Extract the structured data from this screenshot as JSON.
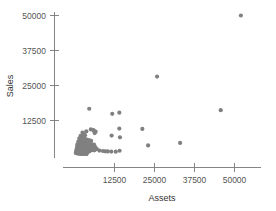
{
  "chart_data": {
    "type": "scatter",
    "title": "",
    "xlabel": "Assets",
    "ylabel": "Sales",
    "xticks": [
      12500,
      25000,
      37500,
      50000
    ],
    "yticks": [
      12500,
      25000,
      37500,
      50000
    ],
    "xtick_labels": [
      "12500",
      "25000",
      "37500",
      "50000"
    ],
    "ytick_labels": [
      "12500",
      "25000",
      "37500",
      "50000"
    ],
    "xlim": [
      0,
      54000
    ],
    "ylim": [
      0,
      52000
    ],
    "grid": false,
    "legend": null,
    "marker_color": "#808080",
    "marker_size": 3,
    "points": [
      [
        52000,
        50000
      ],
      [
        25800,
        28200
      ],
      [
        45700,
        16200
      ],
      [
        4600,
        16700
      ],
      [
        11800,
        14900
      ],
      [
        14000,
        15300
      ],
      [
        14000,
        9600
      ],
      [
        21200,
        9500
      ],
      [
        3700,
        8600
      ],
      [
        5100,
        9300
      ],
      [
        6000,
        8900
      ],
      [
        6600,
        8500
      ],
      [
        11600,
        7100
      ],
      [
        14200,
        6500
      ],
      [
        33000,
        4500
      ],
      [
        23000,
        3600
      ],
      [
        2500,
        8200
      ],
      [
        2900,
        7600
      ],
      [
        3300,
        7200
      ],
      [
        1900,
        7000
      ],
      [
        2200,
        6600
      ],
      [
        2700,
        6300
      ],
      [
        3100,
        6000
      ],
      [
        3600,
        5800
      ],
      [
        4100,
        5600
      ],
      [
        4700,
        5400
      ],
      [
        5200,
        5200
      ],
      [
        1500,
        6100
      ],
      [
        1800,
        5700
      ],
      [
        2100,
        5300
      ],
      [
        2400,
        5000
      ],
      [
        2800,
        4800
      ],
      [
        3200,
        4600
      ],
      [
        3700,
        4400
      ],
      [
        4200,
        4200
      ],
      [
        4800,
        4100
      ],
      [
        5400,
        4000
      ],
      [
        6100,
        3900
      ],
      [
        1200,
        5000
      ],
      [
        1500,
        4700
      ],
      [
        1800,
        4400
      ],
      [
        2100,
        4100
      ],
      [
        2500,
        3900
      ],
      [
        2900,
        3700
      ],
      [
        3400,
        3500
      ],
      [
        3900,
        3400
      ],
      [
        4500,
        3300
      ],
      [
        5100,
        3200
      ],
      [
        5800,
        3100
      ],
      [
        6500,
        3000
      ],
      [
        900,
        4000
      ],
      [
        1200,
        3800
      ],
      [
        1500,
        3500
      ],
      [
        1900,
        3300
      ],
      [
        2300,
        3100
      ],
      [
        2700,
        2900
      ],
      [
        3200,
        2800
      ],
      [
        3700,
        2700
      ],
      [
        4300,
        2600
      ],
      [
        4900,
        2500
      ],
      [
        5600,
        2400
      ],
      [
        6300,
        2300
      ],
      [
        7000,
        2250
      ],
      [
        800,
        3100
      ],
      [
        1100,
        2900
      ],
      [
        1400,
        2700
      ],
      [
        1800,
        2500
      ],
      [
        2200,
        2400
      ],
      [
        2600,
        2300
      ],
      [
        3100,
        2200
      ],
      [
        3600,
        2100
      ],
      [
        4200,
        2000
      ],
      [
        4800,
        1950
      ],
      [
        5500,
        1900
      ],
      [
        6200,
        1850
      ],
      [
        700,
        2400
      ],
      [
        1000,
        2200
      ],
      [
        1300,
        2050
      ],
      [
        1700,
        1900
      ],
      [
        2100,
        1800
      ],
      [
        2500,
        1700
      ],
      [
        3000,
        1650
      ],
      [
        3500,
        1600
      ],
      [
        4100,
        1550
      ],
      [
        4700,
        1500
      ],
      [
        600,
        1800
      ],
      [
        900,
        1650
      ],
      [
        1200,
        1500
      ],
      [
        1600,
        1400
      ],
      [
        2000,
        1300
      ],
      [
        2400,
        1250
      ],
      [
        2900,
        1200
      ],
      [
        3400,
        1150
      ],
      [
        4000,
        1100
      ],
      [
        500,
        1300
      ],
      [
        800,
        1150
      ],
      [
        1100,
        1050
      ],
      [
        1500,
        950
      ],
      [
        1900,
        900
      ],
      [
        2300,
        850
      ],
      [
        2800,
        800
      ],
      [
        3300,
        780
      ],
      [
        400,
        900
      ],
      [
        700,
        800
      ],
      [
        1000,
        720
      ],
      [
        1400,
        650
      ],
      [
        1800,
        600
      ],
      [
        2200,
        570
      ],
      [
        2700,
        550
      ],
      [
        3200,
        530
      ],
      [
        3800,
        520
      ],
      [
        8900,
        1600
      ],
      [
        9600,
        1500
      ],
      [
        10400,
        1450
      ],
      [
        11500,
        1400
      ],
      [
        12900,
        1350
      ],
      [
        14100,
        1700
      ],
      [
        7800,
        1750
      ],
      [
        5900,
        9100
      ],
      [
        6300,
        8000
      ]
    ]
  },
  "axes": {
    "x_axis_name": "assets-axis",
    "y_axis_name": "sales-axis"
  }
}
